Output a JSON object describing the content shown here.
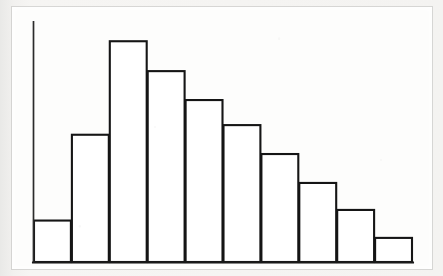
{
  "figure": {
    "kind": "histogram-figure",
    "caption": "",
    "background_color": "#f3f3f2",
    "sheet_color": "#fdfdfc",
    "ink_color": "#151515"
  },
  "chart_data": {
    "type": "bar",
    "title": "",
    "subtitle": "",
    "xlabel": "",
    "ylabel": "",
    "grid": false,
    "legend": false,
    "legend_position": "none",
    "axis": {
      "y_axis_visible": true,
      "x_axis_visible": true,
      "y_tick_labels": [],
      "x_tick_labels": [],
      "ylim": [
        0,
        250
      ],
      "xlim": [
        0,
        10
      ]
    },
    "bar_style": {
      "fill": "#ffffff",
      "stroke": "#151515",
      "stroke_width": 2,
      "gap": 0
    },
    "categories": [
      "1",
      "2",
      "3",
      "4",
      "5",
      "6",
      "7",
      "8",
      "9",
      "10"
    ],
    "values": [
      43,
      132,
      229,
      198,
      168,
      142,
      112,
      82,
      54,
      25
    ],
    "annotations": []
  }
}
